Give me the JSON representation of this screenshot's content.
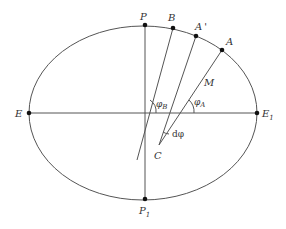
{
  "diagram": {
    "type": "ellipse-geometry",
    "colors": {
      "stroke": "#555555",
      "point": "#111111",
      "text": "#333333"
    },
    "ellipse": {
      "cx": 143,
      "cy": 113,
      "rx": 114,
      "ry": 87
    },
    "points": {
      "P": {
        "label": "P",
        "sub": "",
        "x": 145,
        "y": 25
      },
      "B": {
        "label": "B",
        "sub": "",
        "x": 173,
        "y": 28
      },
      "A_prime": {
        "label": "A",
        "sub": "'",
        "x": 196,
        "y": 36
      },
      "A": {
        "label": "A",
        "sub": "",
        "x": 222,
        "y": 50
      },
      "E": {
        "label": "E",
        "sub": "",
        "x": 29,
        "y": 113
      },
      "E1": {
        "label": "E",
        "sub": "1",
        "x": 257,
        "y": 113
      },
      "P1": {
        "label": "P",
        "sub": "1",
        "x": 145,
        "y": 199
      },
      "C": {
        "label": "C",
        "sub": "",
        "x": 159,
        "y": 145
      }
    },
    "labels": {
      "M": "M",
      "phi_B": {
        "main": "φ",
        "sub": "B"
      },
      "phi_A": {
        "main": "φ",
        "sub": "A"
      },
      "dphi": "dφ"
    }
  }
}
